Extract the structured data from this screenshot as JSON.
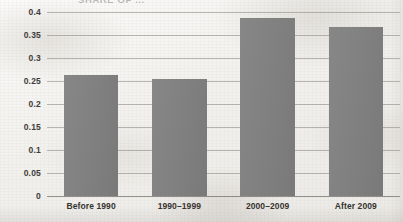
{
  "chart_data": {
    "type": "bar",
    "title": "SHARE OF ...",
    "title_note": "partially cropped at top edge of scan",
    "xlabel": "",
    "ylabel": "",
    "categories": [
      "Before 1990",
      "1990–1999",
      "2000–2009",
      "After 2009"
    ],
    "values": [
      0.263,
      0.254,
      0.387,
      0.367
    ],
    "ylim": [
      0,
      0.4
    ],
    "yticks": [
      "0",
      "0.05",
      "0.1",
      "0.15",
      "0.2",
      "0.25",
      "0.3",
      "0.35",
      "0.4"
    ],
    "ytick_values": [
      0,
      0.05,
      0.1,
      0.15,
      0.2,
      0.25,
      0.3,
      0.35,
      0.4
    ],
    "grid": true,
    "grid_axis": "y",
    "legend": false,
    "legend_position": "none",
    "bar_color": "#808080",
    "gridline_color": "#928e88",
    "background_color": "#f2f1ee",
    "text_color": "#35332f"
  }
}
